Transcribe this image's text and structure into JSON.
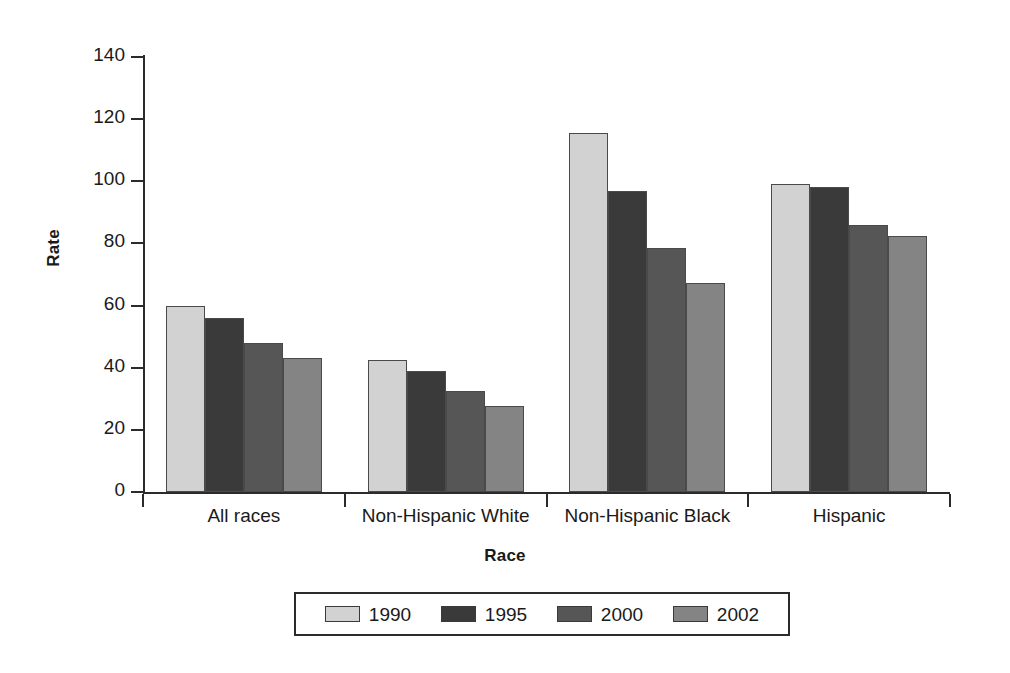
{
  "chart_data": {
    "type": "bar",
    "title": "",
    "xlabel": "Race",
    "ylabel": "Rate",
    "categories": [
      "All races",
      "Non-Hispanic White",
      "Non-Hispanic Black",
      "Hispanic"
    ],
    "series": [
      {
        "name": "1990",
        "color": "#d2d2d2",
        "values": [
          60.0,
          42.5,
          115.5,
          99.0
        ]
      },
      {
        "name": "1995",
        "color": "#3a3a3a",
        "values": [
          56.0,
          39.0,
          96.8,
          98.3
        ]
      },
      {
        "name": "2000",
        "color": "#565656",
        "values": [
          47.8,
          32.5,
          78.5,
          86.0
        ]
      },
      {
        "name": "2002",
        "color": "#848484",
        "values": [
          43.0,
          27.8,
          67.3,
          82.3
        ]
      }
    ],
    "ylim": [
      0,
      140
    ],
    "yticks": [
      0,
      20,
      40,
      60,
      80,
      100,
      120,
      140
    ],
    "ytick_labels": [
      "0",
      "20",
      "40",
      "60",
      "80",
      "100",
      "120",
      "140"
    ],
    "grid": false,
    "legend_position": "bottom"
  }
}
